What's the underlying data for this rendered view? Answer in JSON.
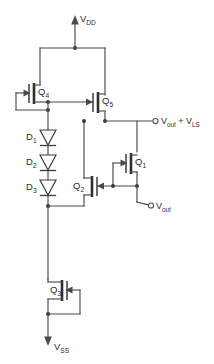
{
  "figure": {
    "type": "circuit-schematic",
    "background_color": "#ffffff",
    "wire_color": "#4a4a4a",
    "device_color": "#2e2e2e",
    "label_color": "#2b2b2b"
  },
  "supplies": {
    "top": {
      "name": "vdd-supply",
      "label_main": "V",
      "label_sub": "DD",
      "arrow_direction": "up"
    },
    "bottom": {
      "name": "vss-supply",
      "label_main": "V",
      "label_sub": "SS",
      "arrow_direction": "down"
    }
  },
  "transistors": [
    {
      "id": "Q4",
      "label_main": "Q",
      "label_sub": "4",
      "role": "upper-left-current-source",
      "gate_side": "left",
      "diode_connected": true
    },
    {
      "id": "Q5",
      "label_main": "Q",
      "label_sub": "5",
      "role": "upper-right-mirror",
      "gate_side": "left",
      "diode_connected": false
    },
    {
      "id": "Q1",
      "label_main": "Q",
      "label_sub": "1",
      "role": "output-source-follower",
      "gate_side": "left",
      "diode_connected": true
    },
    {
      "id": "Q2",
      "label_main": "Q",
      "label_sub": "2",
      "role": "pull-down-driver",
      "gate_side": "right",
      "diode_connected": false
    },
    {
      "id": "Q3",
      "label_main": "Q",
      "label_sub": "3",
      "role": "bottom-current-sink",
      "gate_side": "right",
      "diode_connected": true
    }
  ],
  "diodes": [
    {
      "id": "D1",
      "label_main": "D",
      "label_sub": "1",
      "orientation": "cathode-down"
    },
    {
      "id": "D2",
      "label_main": "D",
      "label_sub": "2",
      "orientation": "cathode-down"
    },
    {
      "id": "D3",
      "label_main": "D",
      "label_sub": "3",
      "orientation": "cathode-down"
    }
  ],
  "terminals": [
    {
      "id": "vout-plus-vls",
      "name": "output-terminal-shifted",
      "text_parts": [
        "V",
        "out",
        " + V",
        "LS"
      ],
      "label_main_a": "V",
      "label_sub_a": "out",
      "label_mid": " + V",
      "label_sub_b": "LS",
      "marker": "open-circle"
    },
    {
      "id": "vout",
      "name": "output-terminal",
      "label_main": "V",
      "label_sub": "out",
      "marker": "open-circle"
    }
  ]
}
